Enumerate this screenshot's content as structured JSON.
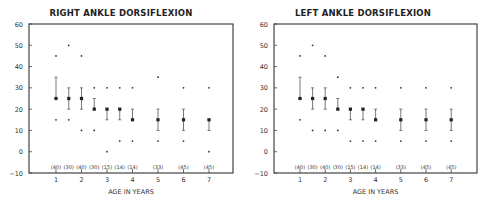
{
  "chart_data": [
    {
      "type": "scatter",
      "title": "RIGHT ANKLE DORSIFLEXION",
      "xlabel": "AGE IN YEARS",
      "ylabel": "",
      "ylim": [
        -10,
        60
      ],
      "yticks": [
        -10,
        0,
        10,
        20,
        30,
        40,
        50,
        60
      ],
      "xticks": [
        1,
        2,
        3,
        4,
        5,
        6,
        7
      ],
      "grid": false,
      "x": [
        1,
        1.5,
        2,
        2.5,
        3,
        3.5,
        4,
        5,
        6,
        7
      ],
      "sample_sizes": [
        "(40)",
        "(30)",
        "(40)",
        "(30)",
        "(15)",
        "(14)",
        "(14)",
        "(33)",
        "(45)",
        "(45)"
      ],
      "series": [
        {
          "name": "mean",
          "values": [
            25,
            25,
            25,
            20,
            20,
            20,
            15,
            15,
            15,
            15
          ]
        },
        {
          "name": "sd_upper",
          "values": [
            35,
            30,
            30,
            25,
            20,
            20,
            20,
            20,
            20,
            15
          ]
        },
        {
          "name": "sd_lower",
          "values": [
            25,
            20,
            20,
            20,
            15,
            15,
            15,
            10,
            10,
            10
          ]
        },
        {
          "name": "max",
          "values": [
            45,
            50,
            45,
            30,
            30,
            30,
            30,
            35,
            30,
            30
          ]
        },
        {
          "name": "min",
          "values": [
            15,
            15,
            10,
            10,
            0,
            5,
            5,
            5,
            5,
            0
          ]
        }
      ]
    },
    {
      "type": "scatter",
      "title": "LEFT ANKLE DORSIFLEXION",
      "xlabel": "AGE IN YEARS",
      "ylabel": "",
      "ylim": [
        -10,
        60
      ],
      "yticks": [
        -10,
        0,
        10,
        20,
        30,
        40,
        50,
        60
      ],
      "xticks": [
        1,
        2,
        3,
        4,
        5,
        6,
        7
      ],
      "grid": false,
      "x": [
        1,
        1.5,
        2,
        2.5,
        3,
        3.5,
        4,
        5,
        6,
        7
      ],
      "sample_sizes": [
        "(40)",
        "(30)",
        "(40)",
        "(30)",
        "(15)",
        "(14)",
        "(14)",
        "(33)",
        "(45)",
        "(45)"
      ],
      "series": [
        {
          "name": "mean",
          "values": [
            25,
            25,
            25,
            20,
            20,
            20,
            15,
            15,
            15,
            15
          ]
        },
        {
          "name": "sd_upper",
          "values": [
            35,
            30,
            30,
            25,
            20,
            20,
            20,
            20,
            20,
            20
          ]
        },
        {
          "name": "sd_lower",
          "values": [
            25,
            20,
            20,
            20,
            15,
            15,
            15,
            10,
            10,
            10
          ]
        },
        {
          "name": "max",
          "values": [
            45,
            50,
            45,
            35,
            30,
            30,
            30,
            30,
            30,
            30
          ]
        },
        {
          "name": "min",
          "values": [
            15,
            10,
            10,
            10,
            5,
            5,
            5,
            5,
            5,
            5
          ]
        }
      ]
    }
  ],
  "charts": [
    {
      "title": "RIGHT ANKLE DORSIFLEXION",
      "xlabel": "AGE IN YEARS"
    },
    {
      "title": "LEFT ANKLE DORSIFLEXION",
      "xlabel": "AGE IN YEARS"
    }
  ]
}
